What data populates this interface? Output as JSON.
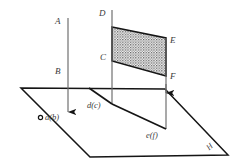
{
  "diagram": {
    "labels": {
      "a_line": "A",
      "b_line": "B",
      "vertex_d": "D",
      "vertex_c": "C",
      "vertex_e": "E",
      "vertex_f": "F",
      "proj_ab": "a(b)",
      "proj_dc": "d(c)",
      "proj_ef": "e(f)",
      "plane_h": "H"
    },
    "colors": {
      "stroke": "#1a1a1a",
      "thin_stroke": "#555555",
      "hatch": "#4a4a4a",
      "label": "#3a3a3a",
      "background": "#ffffff"
    },
    "geometry": {
      "plane_h_polygon": "21,88 165,89 228,155 90,157",
      "quad_cdef_polygon": "112,27 166,38 166,76 112,61",
      "line_ab_x": 68,
      "line_ab_top_y": 18,
      "line_ab_bottom_y": 115,
      "line_dc_x": 112,
      "line_dc_top_y": 10,
      "line_dc_bottom_y": 104,
      "line_ef_x": 166,
      "line_ef_top_y": 38,
      "line_ef_bottom_y": 129,
      "point_ab": "69,117",
      "point_dc": "112,104",
      "point_ef": "166,129"
    }
  }
}
